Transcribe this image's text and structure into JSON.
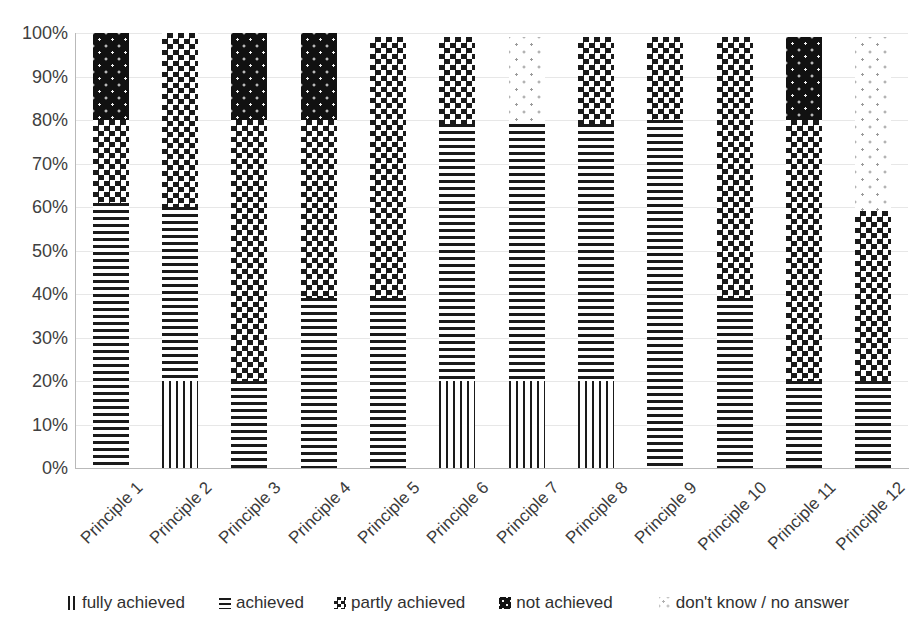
{
  "chart_data": {
    "type": "bar",
    "subtype": "stacked-percentage-bar",
    "title": "",
    "xlabel": "",
    "ylabel": "",
    "ylim": [
      0,
      100
    ],
    "ytick_labels": [
      "0%",
      "10%",
      "20%",
      "30%",
      "40%",
      "50%",
      "60%",
      "70%",
      "80%",
      "90%",
      "100%"
    ],
    "ytick_values": [
      0,
      10,
      20,
      30,
      40,
      50,
      60,
      70,
      80,
      90,
      100
    ],
    "grid": true,
    "legend_position": "bottom",
    "categories": [
      "Principle 1",
      "Principle 2",
      "Principle 3",
      "Principle 4",
      "Principle 5",
      "Principle 6",
      "Principle 7",
      "Principle 8",
      "Principle 9",
      "Principle 10",
      "Principle 11",
      "Principle 12"
    ],
    "series": [
      {
        "name": "fully achieved",
        "pattern": "vertical-stripes",
        "values": [
          0,
          20,
          0,
          0,
          0,
          20,
          20,
          20,
          0,
          0,
          0,
          0
        ]
      },
      {
        "name": "achieved",
        "pattern": "horizontal-stripes",
        "values": [
          61,
          40,
          20,
          39,
          39,
          59,
          59,
          59,
          80,
          39,
          20,
          20
        ]
      },
      {
        "name": "partly achieved",
        "pattern": "checkerboard",
        "values": [
          19,
          40,
          60,
          41,
          60,
          20,
          0,
          20,
          19,
          60,
          60,
          39
        ]
      },
      {
        "name": "not achieved",
        "pattern": "dark-dotted",
        "values": [
          20,
          0,
          20,
          20,
          0,
          0,
          0,
          0,
          0,
          0,
          19,
          0
        ]
      },
      {
        "name": "don't know / no answer",
        "pattern": "light-dots",
        "values": [
          0,
          0,
          0,
          0,
          0,
          0,
          20,
          0,
          0,
          0,
          0,
          40
        ]
      }
    ]
  },
  "legend": {
    "items": [
      {
        "label": "fully achieved",
        "swatch": "vertical-stripes-swatch"
      },
      {
        "label": "achieved",
        "swatch": "horizontal-stripes-swatch"
      },
      {
        "label": "partly achieved",
        "swatch": "checkerboard-swatch"
      },
      {
        "label": "not achieved",
        "swatch": "dark-dotted-swatch"
      },
      {
        "label": "don't know / no answer",
        "swatch": "light-dots-swatch"
      }
    ]
  },
  "colors": {
    "ink": "#1a1a1a",
    "gridline": "#e7e7e7",
    "axis": "#b9b9b9",
    "background": "#ffffff",
    "text": "#3a3a3a"
  }
}
